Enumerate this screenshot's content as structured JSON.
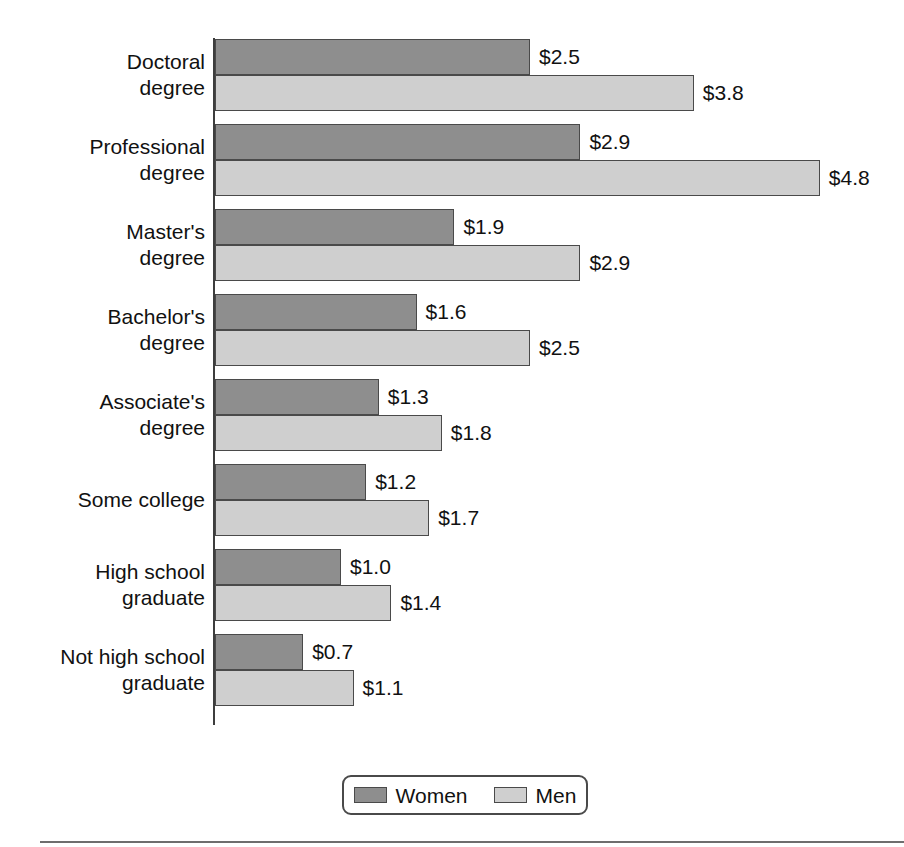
{
  "chart_data": {
    "type": "bar",
    "orientation": "horizontal",
    "title": "",
    "subtitle": "",
    "xlabel": "",
    "ylabel": "",
    "grid": false,
    "value_prefix": "$",
    "xlim": [
      0,
      5.5
    ],
    "legend_position": "bottom-center",
    "categories": [
      "Doctoral\ndegree",
      "Professional\ndegree",
      "Master's\ndegree",
      "Bachelor's\ndegree",
      "Associate's\ndegree",
      "Some college",
      "High school\ngraduate",
      "Not high school\ngraduate"
    ],
    "series": [
      {
        "name": "Women",
        "color": "#8e8e8e",
        "values": [
          2.5,
          2.9,
          1.9,
          1.6,
          1.3,
          1.2,
          1.0,
          0.7
        ],
        "labels": [
          "$2.5",
          "$2.9",
          "$1.9",
          "$1.6",
          "$1.3",
          "$1.2",
          "$1.0",
          "$0.7"
        ]
      },
      {
        "name": "Men",
        "color": "#cfcfcf",
        "values": [
          3.8,
          4.8,
          2.9,
          2.5,
          1.8,
          1.7,
          1.4,
          1.1
        ],
        "labels": [
          "$3.8",
          "$4.8",
          "$2.9",
          "$2.5",
          "$1.8",
          "$1.7",
          "$1.4",
          "$1.1"
        ]
      }
    ]
  },
  "legend": {
    "items": [
      {
        "label": "Women",
        "swatch": "women"
      },
      {
        "label": "Men",
        "swatch": "men"
      }
    ]
  }
}
